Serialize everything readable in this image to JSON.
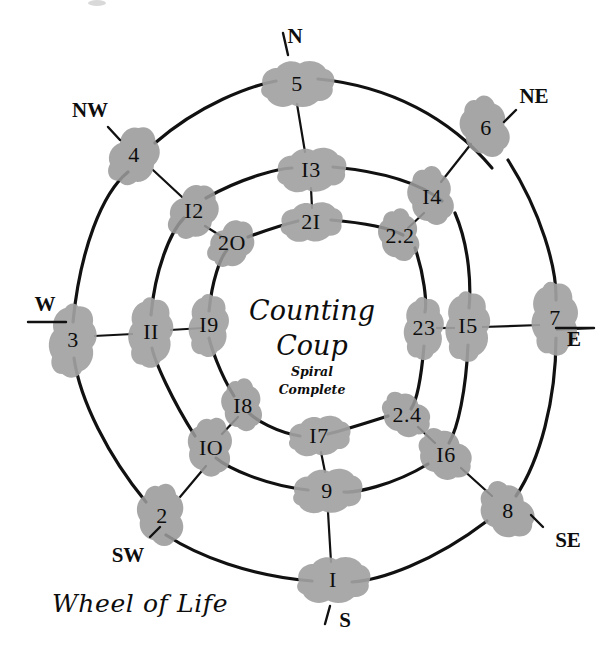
{
  "figure": {
    "center_title_line1": "Counting",
    "center_title_line2": "Coup",
    "center_sub_line1": "Spiral",
    "center_sub_line2": "Complete",
    "caption": "Wheel of Life",
    "ink_color": "#111111",
    "stone_color": "#a2a2a2",
    "background_color": "#ffffff"
  },
  "compass": [
    {
      "id": "n",
      "label": "N",
      "x": 295,
      "y": 38,
      "tick": [
        288,
        55,
        283,
        33
      ]
    },
    {
      "id": "ne",
      "label": "NE",
      "x": 534,
      "y": 98,
      "tick": [
        516,
        110,
        504,
        122
      ]
    },
    {
      "id": "e",
      "label": "E",
      "x": 574,
      "y": 341,
      "tick": [
        556,
        328,
        594,
        328
      ]
    },
    {
      "id": "se",
      "label": "SE",
      "x": 568,
      "y": 542,
      "tick": [
        543,
        527,
        531,
        515
      ]
    },
    {
      "id": "s",
      "label": "S",
      "x": 345,
      "y": 622,
      "tick": [
        330,
        606,
        325,
        624
      ]
    },
    {
      "id": "sw",
      "label": "SW",
      "x": 128,
      "y": 557,
      "tick": [
        150,
        537,
        160,
        527
      ]
    },
    {
      "id": "w",
      "label": "W",
      "x": 45,
      "y": 306,
      "tick": [
        28,
        322,
        66,
        322
      ]
    },
    {
      "id": "nw",
      "label": "NW",
      "x": 90,
      "y": 112,
      "tick": [
        108,
        127,
        120,
        140
      ]
    }
  ],
  "nodes": [
    {
      "num": "1",
      "display": "I",
      "x": 333,
      "y": 580,
      "ring": "outer",
      "rot": -6
    },
    {
      "num": "2",
      "display": "2",
      "x": 162,
      "y": 516,
      "ring": "outer",
      "rot": 72
    },
    {
      "num": "3",
      "display": "3",
      "x": 73,
      "y": 340,
      "ring": "outer",
      "rot": 96
    },
    {
      "num": "4",
      "display": "4",
      "x": 134,
      "y": 155,
      "ring": "outer",
      "rot": -72
    },
    {
      "num": "5",
      "display": "5",
      "x": 297,
      "y": 84,
      "ring": "outer",
      "rot": -6
    },
    {
      "num": "6",
      "display": "6",
      "x": 486,
      "y": 128,
      "ring": "outer",
      "rot": 58
    },
    {
      "num": "7",
      "display": "7",
      "x": 555,
      "y": 318,
      "ring": "outer",
      "rot": 88
    },
    {
      "num": "8",
      "display": "8",
      "x": 508,
      "y": 511,
      "ring": "outer",
      "rot": 36
    },
    {
      "num": "9",
      "display": "9",
      "x": 327,
      "y": 491,
      "ring": "mid",
      "rot": -8
    },
    {
      "num": "10",
      "display": "IO",
      "x": 211,
      "y": 448,
      "ring": "mid",
      "rot": 78
    },
    {
      "num": "11",
      "display": "II",
      "x": 151,
      "y": 332,
      "ring": "mid",
      "rot": 94
    },
    {
      "num": "12",
      "display": "I2",
      "x": 194,
      "y": 211,
      "ring": "mid",
      "rot": -66
    },
    {
      "num": "13",
      "display": "I3",
      "x": 311,
      "y": 170,
      "ring": "mid",
      "rot": -8
    },
    {
      "num": "14",
      "display": "I4",
      "x": 432,
      "y": 197,
      "ring": "mid",
      "rot": 62
    },
    {
      "num": "15",
      "display": "I5",
      "x": 468,
      "y": 326,
      "ring": "mid",
      "rot": 92
    },
    {
      "num": "16",
      "display": "I6",
      "x": 446,
      "y": 455,
      "ring": "mid",
      "rot": 28
    },
    {
      "num": "17",
      "display": "I7",
      "x": 319,
      "y": 436,
      "ring": "inner",
      "rot": -10
    },
    {
      "num": "18",
      "display": "I8",
      "x": 243,
      "y": 406,
      "ring": "inner",
      "rot": 66
    },
    {
      "num": "19",
      "display": "I9",
      "x": 209,
      "y": 325,
      "ring": "inner",
      "rot": 94
    },
    {
      "num": "20",
      "display": "2O",
      "x": 232,
      "y": 243,
      "ring": "inner",
      "rot": -58
    },
    {
      "num": "21",
      "display": "2I",
      "x": 311,
      "y": 222,
      "ring": "inner",
      "rot": -8
    },
    {
      "num": "22",
      "display": "2.2",
      "x": 400,
      "y": 236,
      "ring": "inner",
      "rot": 64
    },
    {
      "num": "23",
      "display": "23",
      "x": 424,
      "y": 328,
      "ring": "inner",
      "rot": 92
    },
    {
      "num": "24",
      "display": "2.4",
      "x": 407,
      "y": 415,
      "ring": "inner",
      "rot": 24
    }
  ],
  "arcs": {
    "outer_ring_label": "outer-spiral-arc",
    "mid_ring_label": "mid-spiral-arc",
    "inner_ring_label": "inner-spiral-arc"
  },
  "connectors": [
    {
      "from": "5",
      "to": "13"
    },
    {
      "from": "13",
      "to": "21"
    },
    {
      "from": "4",
      "to": "12"
    },
    {
      "from": "12",
      "to": "20"
    },
    {
      "from": "6",
      "to": "14"
    },
    {
      "from": "14",
      "to": "22"
    },
    {
      "from": "2",
      "to": "10"
    },
    {
      "from": "10",
      "to": "18"
    },
    {
      "from": "8",
      "to": "16"
    },
    {
      "from": "16",
      "to": "24"
    },
    {
      "from": "1",
      "to": "9"
    },
    {
      "from": "9",
      "to": "17"
    }
  ]
}
